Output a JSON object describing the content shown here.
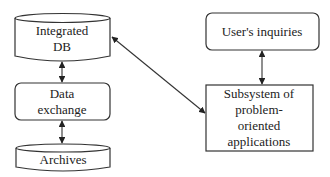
{
  "diagram": {
    "nodes": {
      "integrated_db": {
        "shape": "cylinder",
        "lines": [
          "Integrated",
          "DB"
        ]
      },
      "data_exchange": {
        "shape": "rounded-rect",
        "lines": [
          "Data",
          "exchange"
        ]
      },
      "archives": {
        "shape": "cylinder",
        "lines": [
          "Archives"
        ]
      },
      "users_inquiries": {
        "shape": "rounded-rect",
        "lines": [
          "User's inquiries"
        ]
      },
      "subsystem": {
        "shape": "rect",
        "lines": [
          "Subsystem of",
          "problem-",
          "oriented",
          "applications"
        ]
      }
    },
    "edges": [
      {
        "from": "integrated_db",
        "to": "data_exchange",
        "direction": "both"
      },
      {
        "from": "data_exchange",
        "to": "archives",
        "direction": "both"
      },
      {
        "from": "users_inquiries",
        "to": "subsystem",
        "direction": "both"
      },
      {
        "from": "integrated_db",
        "to": "subsystem",
        "direction": "both"
      }
    ],
    "colors": {
      "stroke": "#333333",
      "fill": "#ffffff",
      "text": "#222222"
    }
  }
}
